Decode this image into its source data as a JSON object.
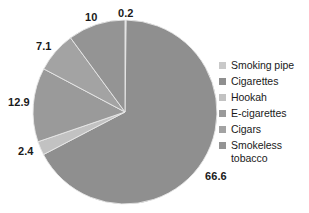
{
  "chart_data": {
    "type": "pie",
    "title": "",
    "subtitle": "",
    "xlabel": "",
    "ylabel": "",
    "grid": false,
    "legend_position": "right",
    "units": "percent",
    "categories": [
      "Smoking pipe",
      "Cigarettes",
      "Hookah",
      "E-cigarettes",
      "Cigars",
      "Smokeless tobacco"
    ],
    "values": [
      0.2,
      66.6,
      2.4,
      12.9,
      7.1,
      10
    ],
    "labels": [
      "0.2",
      "66.6",
      "2.4",
      "12.9",
      "7.1",
      "10"
    ],
    "colors": [
      "#c9c9c9",
      "#8f8f8f",
      "#c2c2c2",
      "#9a9a9a",
      "#a3a3a3",
      "#949494"
    ],
    "slices": [
      {
        "name": "Smoking pipe",
        "value": 0.2,
        "label": "0.2",
        "color": "#c9c9c9"
      },
      {
        "name": "Cigarettes",
        "value": 66.6,
        "label": "66.6",
        "color": "#8f8f8f"
      },
      {
        "name": "Hookah",
        "value": 2.4,
        "label": "2.4",
        "color": "#c2c2c2"
      },
      {
        "name": "E-cigarettes",
        "value": 12.9,
        "label": "12.9",
        "color": "#9a9a9a"
      },
      {
        "name": "Cigars",
        "value": 7.1,
        "label": "7.1",
        "color": "#a3a3a3"
      },
      {
        "name": "Smokeless tobacco",
        "value": 10,
        "label": "10",
        "color": "#949494"
      }
    ]
  },
  "data_labels": [
    {
      "text": "0.2",
      "left": 118,
      "top": 7
    },
    {
      "text": "10",
      "left": 85,
      "top": 11
    },
    {
      "text": "7.1",
      "left": 36,
      "top": 40
    },
    {
      "text": "12.9",
      "left": 8,
      "top": 96
    },
    {
      "text": "2.4",
      "left": 18,
      "top": 145
    },
    {
      "text": "66.6",
      "left": 205,
      "top": 170
    }
  ],
  "legend": {
    "items": [
      {
        "label": "Smoking pipe",
        "color": "#c9c9c9"
      },
      {
        "label": "Cigarettes",
        "color": "#8f8f8f"
      },
      {
        "label": "Hookah",
        "color": "#c2c2c2"
      },
      {
        "label": "E-cigarettes",
        "color": "#9a9a9a"
      },
      {
        "label": "Cigars",
        "color": "#a3a3a3"
      },
      {
        "label": "Smokeless\ntobacco",
        "color": "#949494"
      }
    ]
  },
  "geometry": {
    "center_x": 125,
    "center_y": 112,
    "radius": 92,
    "start_angle_deg": -90
  },
  "style": {
    "background": "#ffffff",
    "label_color": "#1a1a1a",
    "separator_color": "#e8e8e8"
  }
}
